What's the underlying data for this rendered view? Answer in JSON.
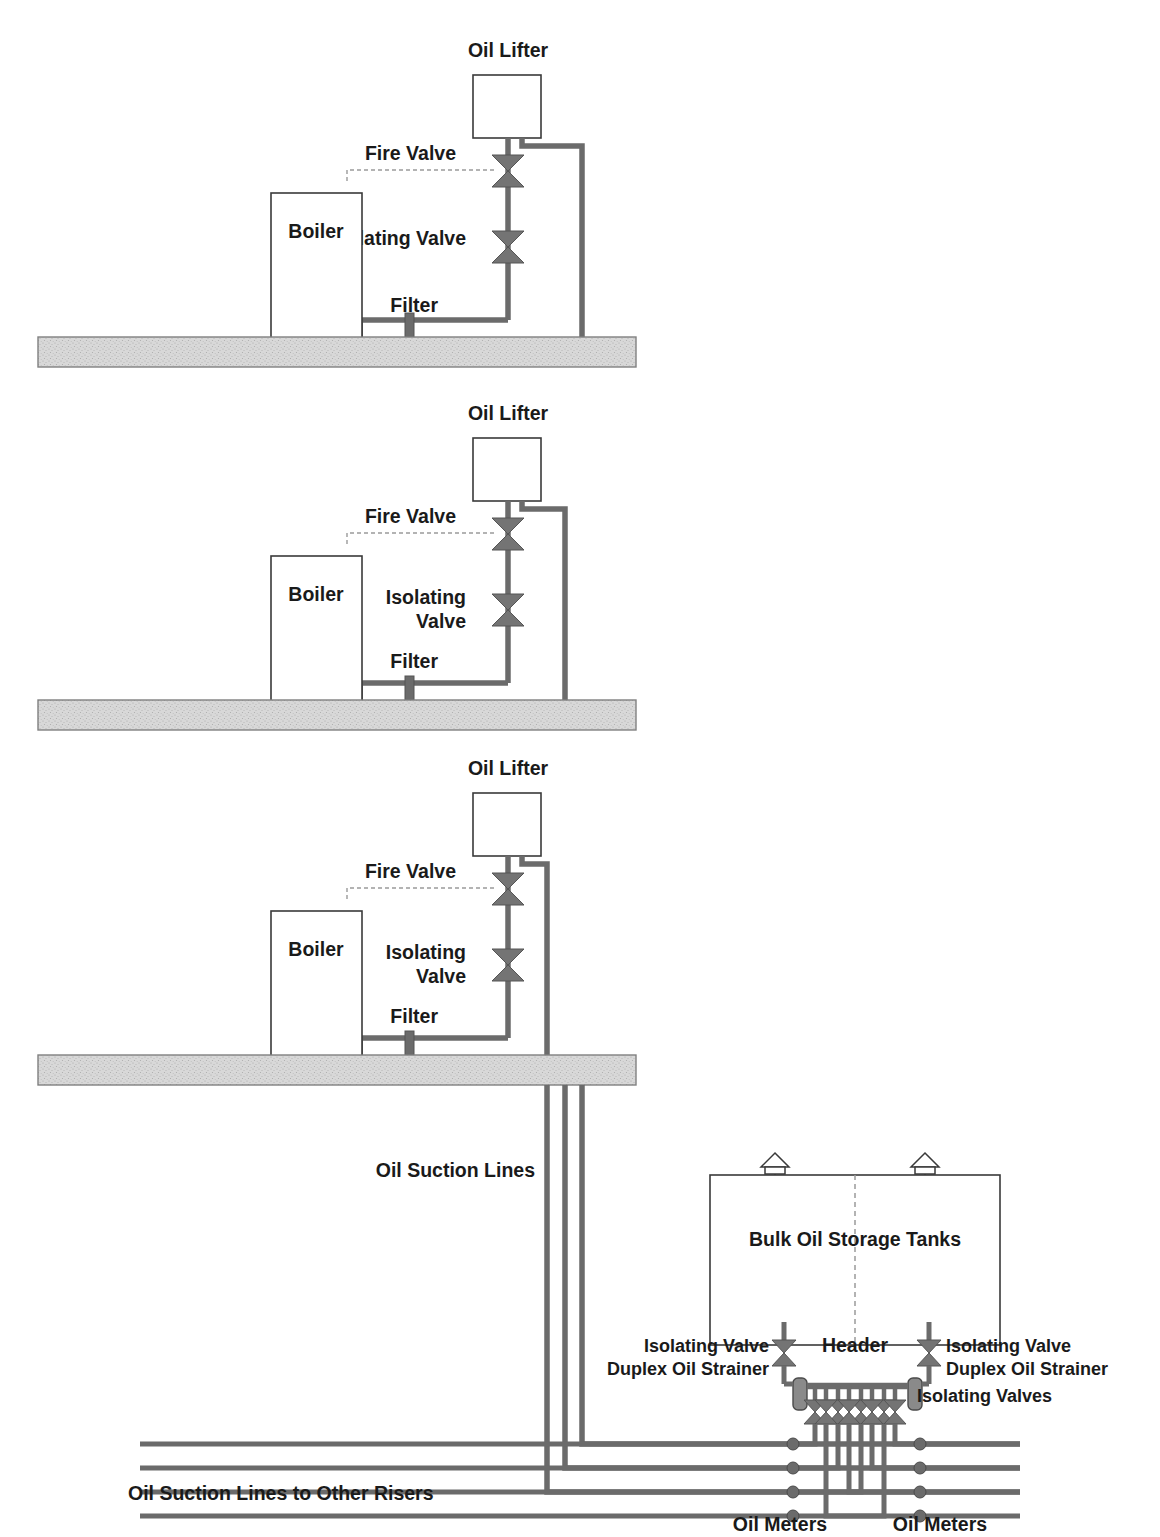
{
  "diagram": {
    "colors": {
      "pipe": "#6b6b6b",
      "valve_fill": "#747474",
      "outline": "#3a3a3a",
      "slab_fill": "#d5d5d5",
      "slab_edge": "#808080",
      "text": "#1a1a1a",
      "dashed": "#9a9a9a",
      "background": "#ffffff"
    },
    "labels": {
      "oil_lifter": "Oil Lifter",
      "fire_valve": "Fire Valve",
      "isolating_valve": "Isolating Valve",
      "isolating_valve_line1": "Isolating",
      "isolating_valve_line2": "Valve",
      "filter": "Filter",
      "boiler": "Boiler",
      "oil_suction_lines": "Oil Suction Lines",
      "bulk_oil_storage_tanks": "Bulk Oil Storage Tanks",
      "header": "Header",
      "duplex_oil_strainer": "Duplex Oil Strainer",
      "isolating_valves": "Isolating Valves",
      "oil_meters": "Oil Meters",
      "oil_suction_lines_to_other_risers": "Oil Suction Lines to Other Risers"
    },
    "floors": [
      {
        "id": "floor-1",
        "level": 1,
        "lifter_label": "Oil Lifter",
        "boiler_label": "Boiler",
        "fire_valve_label": "Fire Valve",
        "isolating_valve_label": "Isolating Valve",
        "filter_label": "Filter",
        "slab_y": 337,
        "riser_x": 582
      },
      {
        "id": "floor-2",
        "level": 2,
        "lifter_label": "Oil Lifter",
        "boiler_label": "Boiler",
        "fire_valve_label": "Fire Valve",
        "isolating_valve_label": "Isolating Valve",
        "filter_label": "Filter",
        "slab_y": 700,
        "riser_x": 565
      },
      {
        "id": "floor-3",
        "level": 3,
        "lifter_label": "Oil Lifter",
        "boiler_label": "Boiler",
        "fire_valve_label": "Fire Valve",
        "isolating_valve_label": "Isolating Valve",
        "filter_label": "Filter",
        "slab_y": 1055,
        "riser_x": 547
      }
    ],
    "risers": {
      "count": 3,
      "x_positions": [
        547,
        565,
        582
      ],
      "label": "Oil Suction Lines"
    },
    "tank": {
      "label": "Bulk Oil Storage Tanks",
      "vent_count": 2,
      "divider": "dashed-center-divider",
      "left_isolating_valve_label": "Isolating Valve",
      "left_duplex_strainer_label": "Duplex Oil Strainer",
      "right_isolating_valve_label": "Isolating Valve",
      "right_duplex_strainer_label": "Duplex Oil Strainer"
    },
    "header": {
      "label": "Header",
      "isolating_valves_label": "Isolating Valves",
      "valve_count": 8
    },
    "meters": {
      "left_label": "Oil Meters",
      "right_label": "Oil Meters",
      "left_count": 4,
      "right_count": 4,
      "line_count": 8
    },
    "bottom_note": "Oil Suction Lines to Other Risers"
  }
}
